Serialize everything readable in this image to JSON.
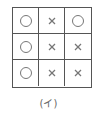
{
  "diagram": {
    "caption": "(イ)",
    "rows": [
      [
        "circle",
        "cross",
        "circle"
      ],
      [
        "circle",
        "cross",
        "cross"
      ],
      [
        "circle",
        "cross",
        "cross"
      ]
    ],
    "colors": {
      "line": "#555555",
      "mark": "#777777"
    }
  }
}
